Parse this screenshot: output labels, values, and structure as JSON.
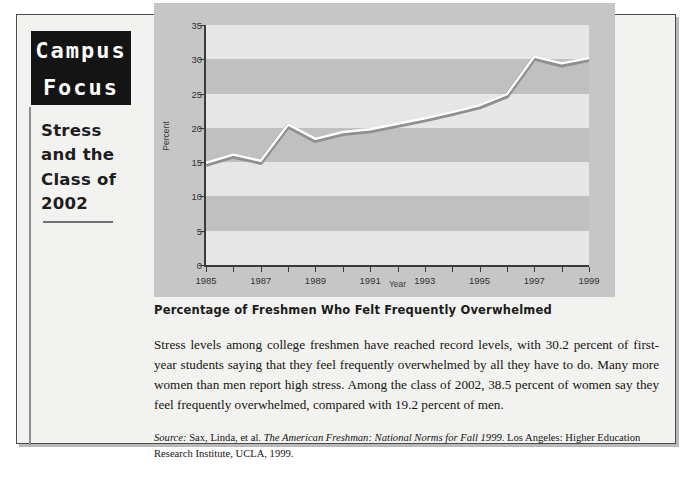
{
  "sidebar": {
    "kicker_line1": "Campus",
    "kicker_line2": "Focus",
    "headline": "Stress and the Class of 2002"
  },
  "chart_caption": "Percentage of Freshmen Who Felt Frequently Overwhelmed",
  "body_text": "Stress levels among college freshmen have reached record levels, with 30.2 percent of first-year students saying that they feel frequently overwhelmed by all they have to do. Many more women than men report high stress. Among the class of 2002, 38.5 percent of women say they feel frequently overwhelmed, compared with 19.2 percent of men.",
  "source": {
    "label": "Source:",
    "authors": " Sax, Linda, et al. ",
    "title": "The American Freshman: National Norms for Fall 1999",
    "publisher": ". Los Angeles: Higher Education Research Institute, UCLA, 1999."
  },
  "colors": {
    "panel_bg": "#c6c6c6",
    "plot_bg": "#c0c0c0",
    "band_light": "#e6e6e6",
    "line_stroke": "#ffffff",
    "line_shadow": "#8f8f8f",
    "axis": "#3a3a3a",
    "kicker_bg": "#141414",
    "frame_border": "#4a4a4a"
  },
  "chart_data": {
    "type": "line",
    "title": "Percentage of Freshmen Who Felt Frequently Overwhelmed",
    "xlabel": "Year",
    "ylabel": "Percent",
    "xlim": [
      1985,
      1999
    ],
    "ylim": [
      0,
      35
    ],
    "ytick_values": [
      0,
      5,
      10,
      15,
      20,
      25,
      30,
      35
    ],
    "ytick_labels": [
      "0",
      "5",
      "10",
      "15",
      "20",
      "25",
      "30",
      "35"
    ],
    "xtick_values": [
      1985,
      1986,
      1987,
      1988,
      1989,
      1990,
      1991,
      1992,
      1993,
      1994,
      1995,
      1996,
      1997,
      1998,
      1999
    ],
    "xtick_labels": [
      "1985",
      "",
      "1987",
      "",
      "1989",
      "",
      "1991",
      "",
      "1993",
      "",
      "1995",
      "",
      "1997",
      "",
      "1999"
    ],
    "grid": "horizontal-bands",
    "legend": "none",
    "x": [
      1985,
      1986,
      1987,
      1988,
      1989,
      1990,
      1991,
      1992,
      1993,
      1994,
      1995,
      1996,
      1997,
      1998,
      1999
    ],
    "values": [
      14.9,
      16.1,
      15.2,
      20.5,
      18.4,
      19.4,
      19.8,
      20.6,
      21.4,
      22.3,
      23.3,
      24.9,
      30.4,
      29.4,
      30.2
    ],
    "series": [
      {
        "name": "Percent frequently overwhelmed",
        "values": [
          14.9,
          16.1,
          15.2,
          20.5,
          18.4,
          19.4,
          19.8,
          20.6,
          21.4,
          22.3,
          23.3,
          24.9,
          30.4,
          29.4,
          30.2
        ]
      }
    ]
  }
}
